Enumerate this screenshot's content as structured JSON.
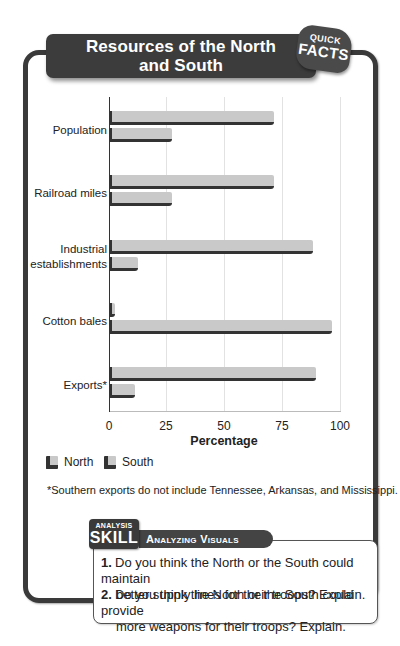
{
  "header": {
    "title_line1": "Resources of the North",
    "title_line2": "and South",
    "badge_small": "QUICK",
    "badge_big": "FACTS"
  },
  "chart_data": {
    "type": "bar",
    "orientation": "horizontal",
    "title": "Resources of the North and South",
    "categories": [
      "Population",
      "Railroad miles",
      "Industrial establishments",
      "Cotton bales",
      "Exports*"
    ],
    "series": [
      {
        "name": "North",
        "values": [
          71,
          71,
          88,
          2,
          89
        ]
      },
      {
        "name": "South",
        "values": [
          27,
          27,
          12,
          96,
          11
        ]
      }
    ],
    "xlabel": "Percentage",
    "ylabel": "",
    "xlim": [
      0,
      100
    ],
    "xticks": [
      "0",
      "25",
      "50",
      "75",
      "100"
    ],
    "grid": true,
    "legend_position": "bottom-left",
    "footnote": "*Southern exports do not include Tennessee, Arkansas, and Mississippi."
  },
  "chart_labels": {
    "cat0": "Population",
    "cat1": "Railroad miles",
    "cat2a": "Industrial",
    "cat2b": "establishments",
    "cat3": "Cotton bales",
    "cat4": "Exports*",
    "legend_north": "North",
    "legend_south": "South"
  },
  "analysis": {
    "tag_small": "ANALYSIS",
    "tag_big": "SKILL",
    "title": "Analyzing Visuals",
    "questions": [
      {
        "num": "1.",
        "line1": "Do you think the North or the South could maintain",
        "line2": "better supply lines for their troops? Explain."
      },
      {
        "num": "2.",
        "line1": "Do you think the North or the South could provide",
        "line2": "more weapons for their troops? Explain."
      }
    ]
  }
}
